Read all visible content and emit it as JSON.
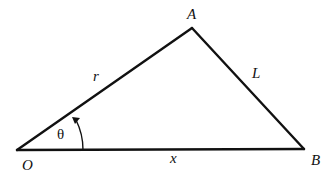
{
  "diagram": {
    "type": "triangle",
    "stroke_color": "#111111",
    "vertices": {
      "O": {
        "label": "O",
        "x": 17,
        "y": 150
      },
      "A": {
        "label": "A",
        "x": 192,
        "y": 28
      },
      "B": {
        "label": "B",
        "x": 304,
        "y": 149
      }
    },
    "sides": {
      "OA": {
        "label": "r"
      },
      "AB": {
        "label": "L"
      },
      "OB": {
        "label": "x"
      }
    },
    "angle": {
      "vertex": "O",
      "label": "θ",
      "arrow_direction": "counterclockwise"
    }
  }
}
